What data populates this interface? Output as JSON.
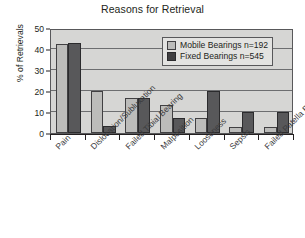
{
  "chart_data": {
    "type": "bar",
    "title": "Reasons for Retrieval",
    "xlabel": "",
    "ylabel": "% of Retrievals",
    "ylim": [
      0,
      50
    ],
    "yticks": [
      0,
      10,
      20,
      30,
      40,
      50
    ],
    "grid": true,
    "legend_position": "top-right",
    "categories": [
      "Pain",
      "Dislocation/Subluxation",
      "Failed Tibial Bearing",
      "Malposition",
      "Looseness",
      "Sepsis",
      "Failed Patella Bearing"
    ],
    "series": [
      {
        "name": "Mobile Bearings n=192",
        "color": "#bcbcba",
        "values": [
          42.5,
          20,
          16.5,
          13.5,
          7,
          3,
          3
        ]
      },
      {
        "name": "Fixed Bearings n=545",
        "color": "#58585a",
        "values": [
          43,
          3.5,
          16.5,
          7,
          20,
          10,
          10
        ]
      }
    ]
  },
  "legend": {
    "items": [
      {
        "label": "Mobile Bearings n=192",
        "swatch": "mobile"
      },
      {
        "label": "Fixed Bearings n=545",
        "swatch": "fixed"
      }
    ]
  },
  "axes": {
    "y_tick_labels": [
      "50",
      "40",
      "30",
      "20",
      "10",
      "0"
    ]
  }
}
